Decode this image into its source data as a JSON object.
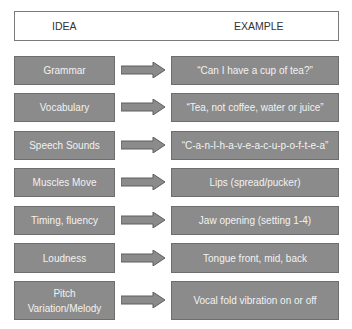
{
  "header": {
    "idea_label": "IDEA",
    "example_label": "EXAMPLE"
  },
  "colors": {
    "box_fill": "#8b8b8b",
    "box_border": "#6e6e6e",
    "text": "#f2f2f2",
    "arrow_fill": "#8b8b8b"
  },
  "rows": [
    {
      "idea": "Grammar",
      "example": "“Can I have a cup of tea?”"
    },
    {
      "idea": "Vocabulary",
      "example": "“Tea, not coffee, water or juice”"
    },
    {
      "idea": "Speech Sounds",
      "example": "“C-a-n-I-h-a-v-e-a-c-u-p-o-f-t-e-a”"
    },
    {
      "idea": "Muscles Move",
      "example": "Lips (spread/pucker)"
    },
    {
      "idea": "Timing, fluency",
      "example": "Jaw opening (setting 1-4)"
    },
    {
      "idea": "Loudness",
      "example": "Tongue front, mid, back"
    },
    {
      "idea": "Pitch Variation/Melody",
      "example": "Vocal fold vibration on or off"
    }
  ]
}
